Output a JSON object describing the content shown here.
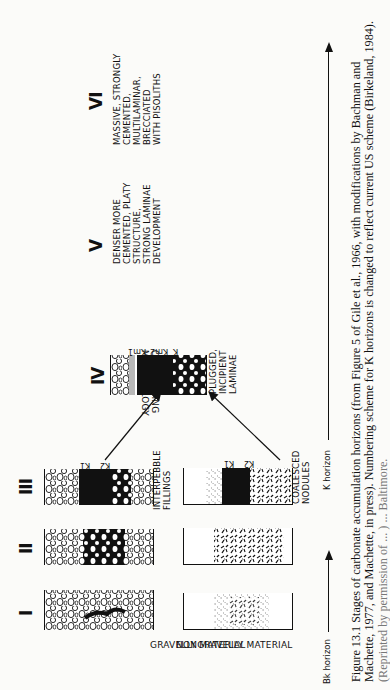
{
  "figure": {
    "stages": [
      {
        "numeral": "I"
      },
      {
        "numeral": "II"
      },
      {
        "numeral": "III",
        "gravelly_note": "INTERPEBBLE\nFILLINGS",
        "nodular_note": "COALESCED\nNODULES",
        "horizon_labels": [
          "K1",
          "K2"
        ]
      },
      {
        "numeral": "IV",
        "note": "PLUGGED,\nINCIPIENT\nLAMINAE",
        "horizon_labels": [
          "Km1",
          "Km2",
          "K"
        ]
      },
      {
        "numeral": "V",
        "note": "DENSER MORE\nCEMENTED, PLATY\nSTRUCTURE,\nSTRONG LAMINAE\nDEVELOPMENT"
      },
      {
        "numeral": "VI",
        "note": "MASSIVE, STRONGLY\nCEMENTED,\nMULTILAMINAR,\nBRECCIATED\nWITH PISOLITHS"
      }
    ],
    "row_labels": {
      "gravelly": "GRAVELLY MATERIAL",
      "nonggravelly": "NONGRAVELLY MATERIAL"
    },
    "converging": "CONVERGING\nMORPHOLOGY",
    "axis": {
      "bk": "Bk horizon",
      "k": "K horizon"
    }
  },
  "caption": {
    "line1": "Figure 13.1   Stages of carbonate accumulation horizons (from Figure 5 of Gile et al., 1966, with modifications by Bachman and",
    "line2": "Machette, 1977, and Machette, in press). Numbering scheme for K horizons is changed to reflect current US scheme (Birkeland, 1984).",
    "line3": "(Reprinted by permission of ... ) ... Baltimore."
  }
}
